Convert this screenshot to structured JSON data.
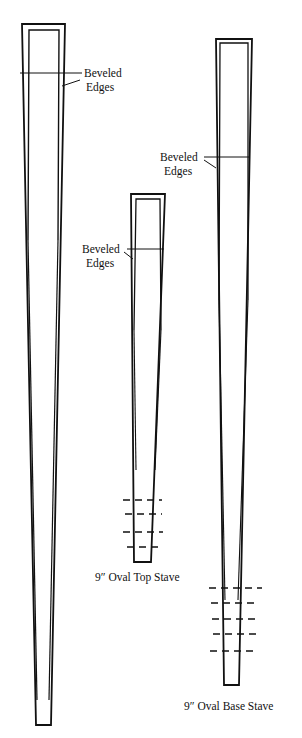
{
  "diagram": {
    "staves": [
      {
        "id": "tall-stave",
        "caption": "",
        "callout": {
          "line1": "Beveled",
          "line2": "Edges"
        },
        "marks": 0
      },
      {
        "id": "top-stave",
        "caption": "9″ Oval Top Stave",
        "callout": {
          "line1": "Beveled",
          "line2": "Edges"
        },
        "marks": 4
      },
      {
        "id": "base-stave",
        "caption": "9″ Oval Base Stave",
        "callout": {
          "line1": "Beveled",
          "line2": "Edges"
        },
        "marks": 5
      }
    ],
    "line_color": "#111111",
    "background": "#ffffff"
  }
}
